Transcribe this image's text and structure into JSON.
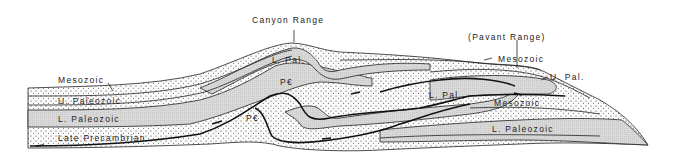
{
  "diagram": {
    "type": "geologic-cross-section",
    "range_labels": {
      "canyon": "Canyon Range",
      "pavant": "(Pavant Range)"
    },
    "unit_labels": {
      "mesozoic_west": "Mesozoic",
      "upper_paleozoic_west": "U. Paleozoic",
      "lower_paleozoic_west": "L. Paleozoic",
      "late_precambrian_west": "Late Precambrian",
      "lower_pal_canyon": "L. Pal.",
      "precambrian_upper": "P€",
      "precambrian_lower": "P€",
      "mesozoic_pavant_top": "Mesozoic",
      "upper_pal_pavant": "U. Pal.",
      "lower_pal_center": "L. Pal.",
      "mesozoic_pavant_mid": "Mesozoic",
      "lower_paleozoic_east": "L. Paleozoic"
    },
    "fill_patterns": {
      "stipple": "dotted",
      "gray": "shaded"
    },
    "colors": {
      "line": "#222222",
      "gray_fill": "#d4d4d4",
      "background": "#ffffff"
    }
  }
}
